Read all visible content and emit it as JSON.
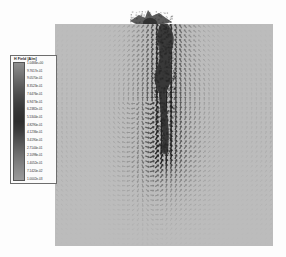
{
  "figure": {
    "type": "vector-field-plot",
    "background_color": "#fdfdfd",
    "domain_fill_color": "#b9b9b9"
  },
  "legend": {
    "title": "H Field [A/m]",
    "units": "A/m",
    "border_color": "#6d6d6d",
    "background_color": "#fbfbfb",
    "colormap": "grayscale",
    "colorbar_top_color": "#8f8f8f",
    "colorbar_mid_color": "#2e2e2e",
    "colorbar_bottom_color": "#9a9a9a",
    "ticks": [
      "1.0466e+00",
      "9.7617e-01",
      "9.0570e-01",
      "8.3523e-01",
      "7.6476e-01",
      "6.9473e-01",
      "6.2382e-01",
      "5.5344e-01",
      "4.8290e-01",
      "4.1236e-01",
      "3.4190e-01",
      "2.7144e-01",
      "2.1098e-01",
      "1.4052e-01",
      "7.1420e-02",
      "1.0002e-03"
    ]
  },
  "chart_data": {
    "type": "vector-field",
    "title": "",
    "xlabel": "",
    "ylabel": "",
    "colorbar_label": "H Field [A/m]",
    "value_min": "1.0002e-03",
    "value_max": "1.0466e+00",
    "grid": "uniform square lattice of arrow glyphs",
    "grid_columns": 46,
    "grid_rows": 46,
    "features": [
      {
        "name": "central-plume",
        "description": "dark high-magnitude vertical structure near top-centre of domain",
        "x_fraction": 0.5,
        "y_fraction_top": 0.0,
        "y_fraction_bottom": 0.58
      },
      {
        "name": "plume-cap",
        "description": "flared dark feature extending above the top boundary of the domain",
        "x_fraction": 0.5,
        "y_fraction": -0.08
      }
    ]
  }
}
